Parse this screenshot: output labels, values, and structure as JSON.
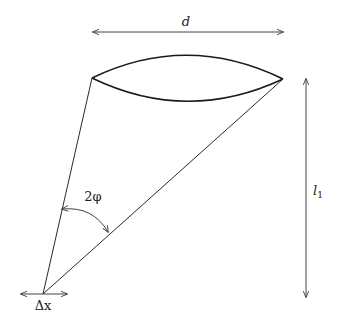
{
  "diagram": {
    "labels": {
      "diameter": "d",
      "angle": "2φ",
      "distance_main": "l",
      "distance_sub": "1",
      "displacement": "Δx"
    }
  }
}
